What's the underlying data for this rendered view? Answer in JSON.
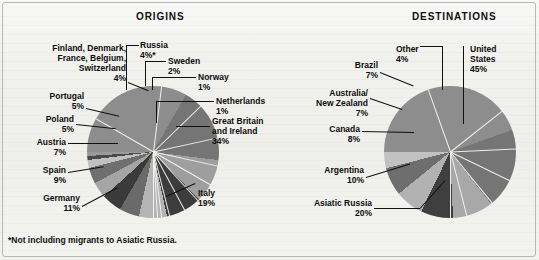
{
  "figure": {
    "background_color": "#f1f1ee",
    "frame_color": "#b9b9b4",
    "footnote": "*Not including migrants to Asiatic Russia."
  },
  "panels": {
    "origins_title": "ORIGINS",
    "destinations_title": "DESTINATIONS"
  },
  "labels": {
    "origins": {
      "finland_group": "Finland, Denmark,\nFrance, Belgium,\nSwitzerland",
      "finland_group_line1": "Finland, Denmark,",
      "finland_group_line2": "France, Belgium,",
      "finland_group_line3": "Switzerland",
      "finland_group_pct": "4%",
      "portugal": "Portugal",
      "portugal_pct": "5%",
      "poland": "Poland",
      "poland_pct": "5%",
      "austria": "Austria",
      "austria_pct": "7%",
      "spain": "Spain",
      "spain_pct": "9%",
      "germany": "Germany",
      "germany_pct": "11%",
      "italy": "Italy",
      "italy_pct": "19%",
      "great_britain_line1": "Great Britain",
      "great_britain_line2": "and Ireland",
      "great_britain_pct": "34%",
      "netherlands": "Netherlands",
      "netherlands_pct": "1%",
      "norway": "Norway",
      "norway_pct": "1%",
      "sweden": "Sweden",
      "sweden_pct": "2%",
      "russia": "Russia",
      "russia_pct": "4%*"
    },
    "destinations": {
      "united_states_line1": "United",
      "united_states_line2": "States",
      "united_states_pct": "45%",
      "other": "Other",
      "other_pct": "4%",
      "brazil": "Brazil",
      "brazil_pct": "7%",
      "australia_line1": "Australia/",
      "australia_line2": "New Zealand",
      "australia_pct": "7%",
      "canada": "Canada",
      "canada_pct": "8%",
      "argentina": "Argentina",
      "argentina_pct": "10%",
      "asiatic_russia": "Asiatic Russia",
      "asiatic_russia_pct": "20%"
    }
  },
  "chart_data": [
    {
      "type": "pie",
      "title": "ORIGINS",
      "id": "origins",
      "note": "*Not including migrants to Asiatic Russia.",
      "start_angle_deg": -90,
      "direction": "clockwise",
      "center": [
        153,
        152
      ],
      "radius": 66,
      "categories": [
        "Great Britain and Ireland",
        "Italy",
        "Germany",
        "Spain",
        "Austria",
        "Poland",
        "Portugal",
        "Finland, Denmark, France, Belgium, Switzerland",
        "Russia",
        "Sweden",
        "Norway",
        "Netherlands"
      ],
      "values": [
        34,
        19,
        11,
        9,
        7,
        5,
        5,
        4,
        4,
        2,
        1,
        1
      ],
      "unit": "%",
      "colors": [
        "#8d8d8d",
        "#757575",
        "#9e9e9e",
        "#3c3c3c",
        "#b4b4b4",
        "#6a6a6a",
        "#3a3a3a",
        "#a5a5a5",
        "#6f6f6f",
        "#c0c0c0",
        "#4a4a4a",
        "#9a9a9a"
      ]
    },
    {
      "type": "pie",
      "title": "DESTINATIONS",
      "id": "destinations",
      "start_angle_deg": -90,
      "direction": "clockwise",
      "center": [
        450,
        152
      ],
      "radius": 66,
      "categories": [
        "United States",
        "Asiatic Russia",
        "Argentina",
        "Canada",
        "Australia/New Zealand",
        "Brazil",
        "Other"
      ],
      "values": [
        45,
        20,
        10,
        8,
        7,
        7,
        4
      ],
      "unit": "%",
      "colors": [
        "#8d8d8d",
        "#757575",
        "#a8a8a8",
        "#3f3f3f",
        "#b2b2b2",
        "#6e6e6e",
        "#c2c2c2"
      ]
    }
  ]
}
